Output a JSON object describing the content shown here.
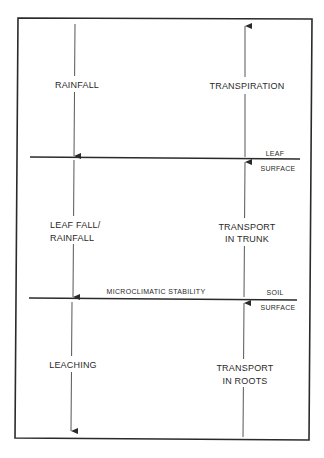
{
  "diagram": {
    "layers": {
      "leaf_surface": {
        "label_top": "LEAF",
        "label_bottom": "SURFACE"
      },
      "soil_surface": {
        "label_top": "SOIL",
        "label_bottom": "SURFACE",
        "annotation": "MICROCLIMATIC STABILITY"
      }
    },
    "zones": [
      {
        "name": "atmosphere",
        "down_flow": [
          "RAINFALL"
        ],
        "up_flow": [
          "TRANSPIRATION"
        ]
      },
      {
        "name": "canopy",
        "down_flow": [
          "LEAF FALL/",
          "RAINFALL"
        ],
        "up_flow": [
          "TRANSPORT",
          "IN TRUNK"
        ]
      },
      {
        "name": "soil",
        "down_flow": [
          "LEACHING"
        ],
        "up_flow": [
          "TRANSPORT",
          "IN ROOTS"
        ]
      }
    ],
    "colors": {
      "ink": "#2a2a2a",
      "background": "#ffffff"
    }
  }
}
